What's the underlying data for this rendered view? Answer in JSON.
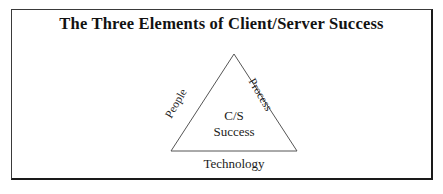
{
  "figure": {
    "title": "The Three Elements of Client/Server Success",
    "frame_color": "#1a1a1a",
    "background_color": "#ffffff",
    "text_color": "#1b1b1b"
  },
  "diagram": {
    "type": "triangle",
    "shape_name": "triangle-outline",
    "stroke_color": "#555555",
    "apex_label": null,
    "edge_labels": {
      "left": "People",
      "right": "Process",
      "bottom": "Technology"
    },
    "center": {
      "line1": "C/S",
      "line2": "Success"
    }
  }
}
